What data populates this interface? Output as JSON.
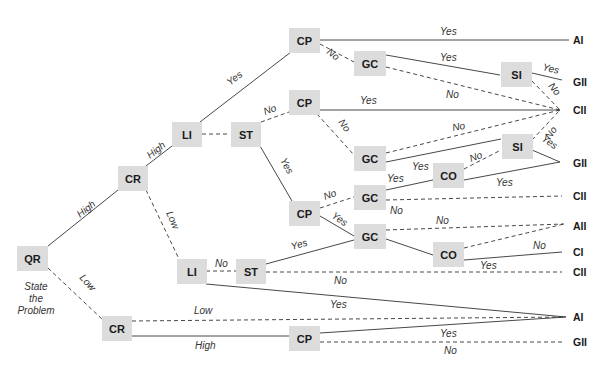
{
  "diagram": {
    "type": "decision-tree",
    "caption": [
      "State",
      "the",
      "Problem"
    ],
    "nodes": {
      "qr": {
        "label": "QR",
        "x": 32,
        "y": 258
      },
      "cr1": {
        "label": "CR",
        "x": 133,
        "y": 178
      },
      "li1": {
        "label": "LI",
        "x": 186,
        "y": 134
      },
      "st1": {
        "label": "ST",
        "x": 246,
        "y": 134
      },
      "cp1": {
        "label": "CP",
        "x": 304,
        "y": 40
      },
      "gc1": {
        "label": "GC",
        "x": 370,
        "y": 63
      },
      "si1": {
        "label": "SI",
        "x": 516,
        "y": 75
      },
      "cp2": {
        "label": "CP",
        "x": 304,
        "y": 102
      },
      "gc2": {
        "label": "GC",
        "x": 370,
        "y": 158
      },
      "si2": {
        "label": "SI",
        "x": 517,
        "y": 146
      },
      "co1": {
        "label": "CO",
        "x": 449,
        "y": 175
      },
      "cp3": {
        "label": "CP",
        "x": 304,
        "y": 213
      },
      "gc3": {
        "label": "GC",
        "x": 370,
        "y": 197
      },
      "gc4": {
        "label": "GC",
        "x": 370,
        "y": 236
      },
      "co2": {
        "label": "CO",
        "x": 449,
        "y": 254
      },
      "li2": {
        "label": "LI",
        "x": 191,
        "y": 271
      },
      "st2": {
        "label": "ST",
        "x": 251,
        "y": 271
      },
      "cr2": {
        "label": "CR",
        "x": 117,
        "y": 329
      },
      "cp4": {
        "label": "CP",
        "x": 304,
        "y": 338
      }
    },
    "terminals": [
      {
        "label": "AI",
        "y": 40
      },
      {
        "label": "GII",
        "y": 82
      },
      {
        "label": "CII",
        "y": 110
      },
      {
        "label": "GII",
        "y": 163
      },
      {
        "label": "CII",
        "y": 196
      },
      {
        "label": "AII",
        "y": 226
      },
      {
        "label": "CI",
        "y": 252
      },
      {
        "label": "CII",
        "y": 272
      },
      {
        "label": "AI",
        "y": 317
      },
      {
        "label": "GII",
        "y": 342
      }
    ],
    "edge_labels": {
      "qr_cr1": "High",
      "qr_cr2": "Low",
      "cr1_li1": "High",
      "cr1_li2": "Low",
      "li1_cp1": "Yes",
      "st1_cp2": "No",
      "st1_cp3": "Yes",
      "cp1_ai": "Yes",
      "cp1_gc1": "No",
      "gc1_si1": "Yes",
      "gc1_cii": "No",
      "si1_gii": "Yes",
      "si1_cii": "No",
      "cp2_cii": "Yes",
      "cp2_gc2": "No",
      "gc2_cii": "No",
      "si2_cii": "No",
      "si2_gii": "Yes",
      "co1_si2": "No",
      "gc2_co1": "Yes",
      "gc3_co1": "Yes",
      "co1_gii": "Yes",
      "cp3_gc3": "No",
      "gc3_cii": "No",
      "cp3_gc4": "Yes",
      "gc4_aii": "No",
      "co2_ci": "No",
      "co2_cii": "Yes",
      "li2_st2": "No",
      "st2_gc4": "Yes",
      "st2_cii": "No",
      "li2_ai": "Yes",
      "cr2_ai": "Low",
      "cr2_cp4": "High",
      "cp4_ai": "Yes",
      "cp4_gii": "No"
    }
  }
}
